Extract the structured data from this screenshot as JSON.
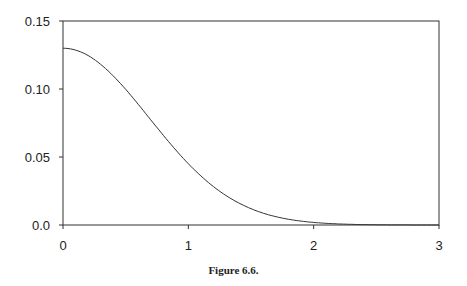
{
  "caption": "Figure 6.6.",
  "chart_data": {
    "type": "line",
    "title": "",
    "xlabel": "",
    "ylabel": "",
    "xlim": [
      0,
      3
    ],
    "ylim": [
      0,
      0.15
    ],
    "xticks": [
      "0",
      "1",
      "2",
      "3"
    ],
    "yticks": [
      "0.0",
      "0.05",
      "0.10",
      "0.15"
    ],
    "grid": false,
    "series": [
      {
        "name": "curve",
        "x": [
          0,
          0.25,
          0.5,
          0.75,
          1.0,
          1.25,
          1.5,
          1.75,
          2.0,
          2.25,
          2.5,
          2.75,
          3.0
        ],
        "y": [
          0.13,
          0.121,
          0.099,
          0.072,
          0.045,
          0.025,
          0.012,
          0.005,
          0.002,
          0.0006,
          0.0002,
          0.0,
          0.0
        ]
      }
    ]
  }
}
